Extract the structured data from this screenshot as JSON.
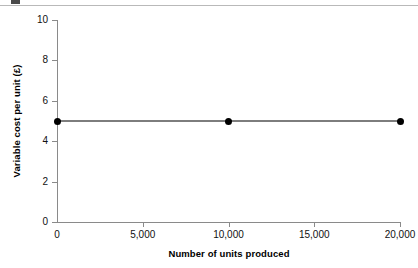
{
  "figure": {
    "background_color": "#ffffff",
    "rule_color": "#b9b9b9",
    "axis_color": "#8a8a8a",
    "text_color": "#111111"
  },
  "chart_data": {
    "type": "line",
    "title": "",
    "subtitle": "",
    "xlabel": "Number of units produced",
    "ylabel": "Variable cost per unit (£)",
    "xlim": [
      0,
      20000
    ],
    "ylim": [
      0,
      10
    ],
    "grid": false,
    "legend": false,
    "legend_position": "none",
    "line_color": "#7d7d7d",
    "marker_color": "#000000",
    "marker_shape": "circle",
    "xticks": [
      0,
      5000,
      10000,
      15000,
      20000
    ],
    "xticklabels": [
      "0",
      "5,000",
      "10,000",
      "15,000",
      "20,000"
    ],
    "yticks": [
      0,
      2,
      4,
      6,
      8,
      10
    ],
    "yticklabels": [
      "0",
      "2",
      "4",
      "6",
      "8",
      "10"
    ],
    "x": [
      0,
      10000,
      20000
    ],
    "values": [
      5,
      5,
      5
    ],
    "series": [
      {
        "name": "Variable cost per unit",
        "x": [
          0,
          10000,
          20000
        ],
        "values": [
          5,
          5,
          5
        ]
      }
    ],
    "annotations": []
  }
}
